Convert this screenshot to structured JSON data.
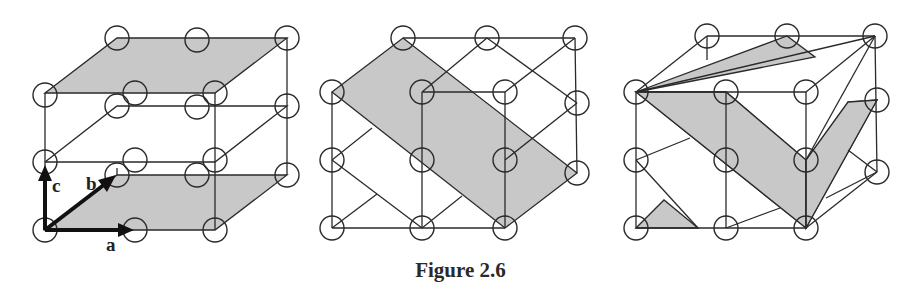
{
  "caption": "Figure 2.6",
  "axes": {
    "a": "a",
    "b": "b",
    "c": "c"
  },
  "colors": {
    "plane_fill": "#c8c8c8",
    "line": "#2a2a2a",
    "background": "#ffffff"
  },
  "panels": [
    {
      "id": "panel-1",
      "description": "Lattice with two shaded horizontal (001)-type planes (top and bottom faces) and a, b, c axis vectors"
    },
    {
      "id": "panel-2",
      "description": "Lattice with one shaded diagonal plane cutting through the cell"
    },
    {
      "id": "panel-3",
      "description": "Lattice with shaded diagonal planes forming a zig-zag set of parallel planes"
    }
  ]
}
